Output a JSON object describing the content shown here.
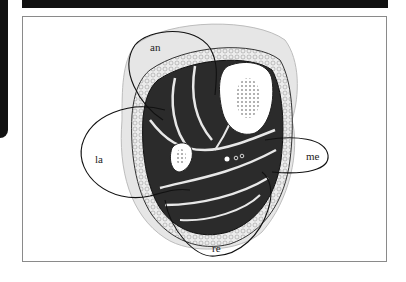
{
  "figure": {
    "type": "anatomical cross-section diagram",
    "regions": [
      {
        "id": "an",
        "label": "an"
      },
      {
        "id": "la",
        "label": "la"
      },
      {
        "id": "me",
        "label": "me"
      },
      {
        "id": "re",
        "label": "re"
      }
    ]
  },
  "colors": {
    "muscle": "#2a2a2a",
    "fascia": "#e8e8e8",
    "bone": "#ffffff",
    "outline": "#111111",
    "skin": "#d8d8d8",
    "frame_border": "#8a8a8a"
  }
}
